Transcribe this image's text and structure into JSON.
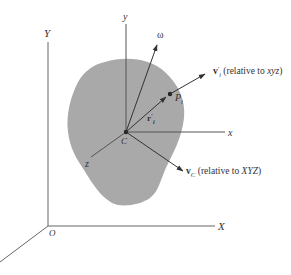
{
  "figure": {
    "colors": {
      "body_fill": "#a9a9a9",
      "line": "#555555",
      "text": "#333333",
      "background": "#ffffff"
    },
    "fixed_frame": {
      "origin_label": "O",
      "x_label": "X",
      "y_label": "Y",
      "z_label": ""
    },
    "moving_frame": {
      "origin_label": "C",
      "x_label": "x",
      "y_label": "y",
      "z_label": "z"
    },
    "vectors": {
      "omega_label": "ω",
      "r_label": "r",
      "r_prime": "′",
      "r_sub": "i",
      "point_label": "P",
      "point_sub": "i",
      "vi_label": "v",
      "vi_prime": "′",
      "vi_sub": "i",
      "vi_note_prefix": " (relative to ",
      "vi_note_frame": "xyz",
      "vi_note_suffix": ")",
      "vc_label": "v",
      "vc_sub": "C",
      "vc_note_prefix": " (relative to ",
      "vc_note_frame": "XYZ",
      "vc_note_suffix": ")"
    }
  }
}
